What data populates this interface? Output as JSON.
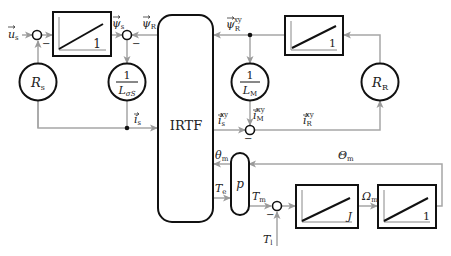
{
  "blocks": {
    "irtf": {
      "label": "IRTF"
    },
    "integrator_stator": {
      "gain": "1"
    },
    "integrator_rotor": {
      "gain": "1"
    },
    "integrator_inertia": {
      "gain": "J"
    },
    "integrator_angle": {
      "gain": "1"
    },
    "pole_pairs": {
      "label": "p"
    },
    "rs": {
      "label": "R",
      "sub": "s"
    },
    "rr": {
      "label": "R",
      "sub": "R"
    },
    "inv_lsigma": {
      "num": "1",
      "den": "L",
      "den_sub": "σS"
    },
    "inv_lm": {
      "num": "1",
      "den": "L",
      "den_sub": "M"
    }
  },
  "signals": {
    "us": {
      "main": "u",
      "sub": "s"
    },
    "psi_s": {
      "main": "ψ",
      "sub": "s"
    },
    "psi_r": {
      "main": "ψ",
      "sub": "R"
    },
    "psi_r_xy": {
      "main": "ψ",
      "sub": "R",
      "sup": "xy"
    },
    "is": {
      "main": "i",
      "sub": "s"
    },
    "is_xy": {
      "main": "i",
      "sub": "s",
      "sup": "xy"
    },
    "im_xy": {
      "main": "i",
      "sub": "M",
      "sup": "xy"
    },
    "ir_xy": {
      "main": "i",
      "sub": "R",
      "sup": "xy"
    },
    "theta_m_small": {
      "main": "θ",
      "sub": "m"
    },
    "theta_m_big": {
      "main": "Θ",
      "sub": "m"
    },
    "te": {
      "main": "T",
      "sub": "e"
    },
    "tm": {
      "main": "T",
      "sub": "m"
    },
    "tl": {
      "main": "T",
      "sub": "l"
    },
    "omega_m": {
      "main": "Ω",
      "sub": "m"
    }
  },
  "signs": {
    "minus": "−"
  },
  "colors": {
    "line": "#a6a6a6",
    "block": "#111111"
  }
}
